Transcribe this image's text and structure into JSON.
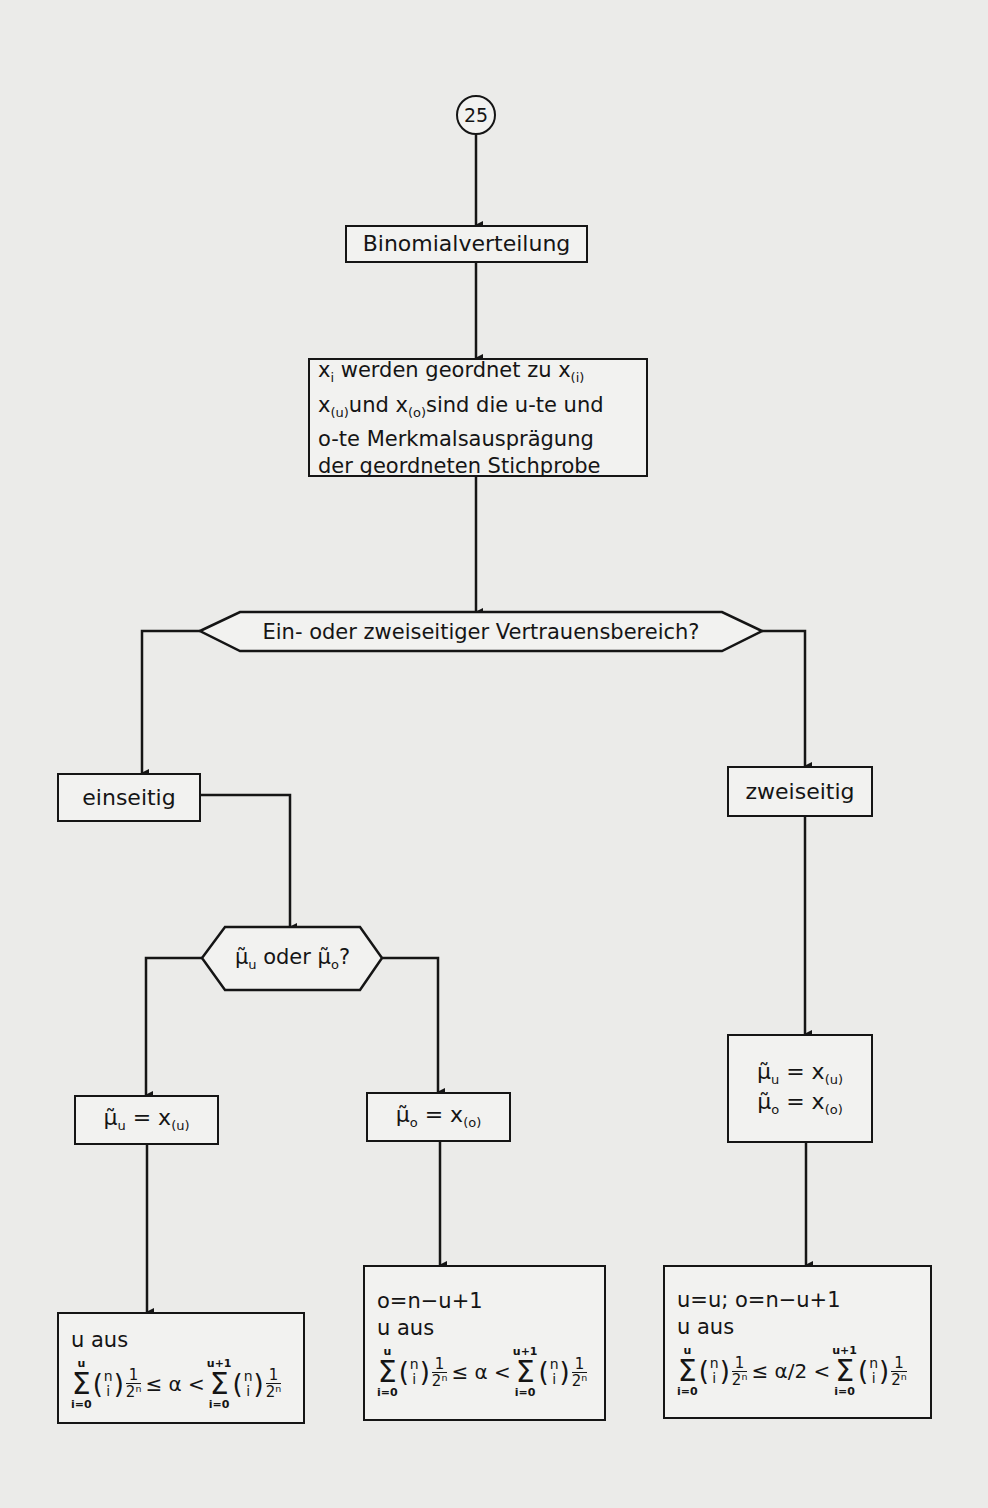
{
  "connector": {
    "label": "25"
  },
  "nodes": {
    "start": {
      "label": "Binomialverteilung"
    },
    "sort": {
      "lines": [
        "x_i werden geordnet zu x_(i)",
        "x_(u) und x_(o) sind die u-te und",
        "o-te Merkmalsausprägung",
        "der geordneten Stichprobe"
      ],
      "line1_a": "x",
      "line1_a_sub": "i",
      "line1_b": " werden geordnet zu x",
      "line1_b_sub": "(i)",
      "line2_a": "x",
      "line2_a_sub": "(u)",
      "line2_b": "und x",
      "line2_b_sub": "(o)",
      "line2_c": "sind die u-te und",
      "line3": "o-te Merkmalsausprägung",
      "line4": "der geordneten Stichprobe"
    },
    "decision_sides": {
      "label": "Ein- oder zweiseitiger Vertrauensbereich?"
    },
    "one_sided": {
      "label": "einseitig"
    },
    "two_sided": {
      "label": "zweiseitig"
    },
    "decision_bound": {
      "label": "μ̃u oder μ̃o?",
      "mu": "μ̃",
      "sub_u": "u",
      "mid": " oder ",
      "sub_o": "o",
      "q": "?"
    },
    "lower": {
      "lhs": "μ̃",
      "lhs_sub": "u",
      "eq": " = x",
      "rhs_sub": "(u)"
    },
    "upper": {
      "lhs": "μ̃",
      "lhs_sub": "o",
      "eq": " = x",
      "rhs_sub": "(o)"
    },
    "both": {
      "line1": {
        "lhs": "μ̃",
        "lhs_sub": "u",
        "eq": " = x",
        "rhs_sub": "(u)"
      },
      "line2": {
        "lhs": "μ̃",
        "lhs_sub": "o",
        "eq": " = x",
        "rhs_sub": "(o)"
      }
    },
    "result_lower": {
      "line1": "u aus",
      "formula": {
        "upper1": "u",
        "lower1": "i=0",
        "rel1": "≤ α <",
        "upper2": "u+1",
        "lower2": "i=0",
        "binom_top": "n",
        "binom_bot": "i",
        "frac_num": "1",
        "frac_den": "2ⁿ"
      }
    },
    "result_upper": {
      "line0": "o=n−u+1",
      "line1": "u aus",
      "formula": {
        "upper1": "u",
        "lower1": "i=0",
        "rel1": "≤ α <",
        "upper2": "u+1",
        "lower2": "i=0",
        "binom_top": "n",
        "binom_bot": "i",
        "frac_num": "1",
        "frac_den": "2ⁿ"
      }
    },
    "result_both": {
      "line0": "u=u; o=n−u+1",
      "line1": "u aus",
      "formula": {
        "upper1": "u",
        "lower1": "i=0",
        "rel1": "≤ α/2 <",
        "upper2": "u+1",
        "lower2": "i=0",
        "binom_top": "n",
        "binom_bot": "i",
        "frac_num": "1",
        "frac_den": "2ⁿ"
      }
    }
  },
  "colors": {
    "ink": "#151515",
    "paper": "#ebebe9"
  }
}
